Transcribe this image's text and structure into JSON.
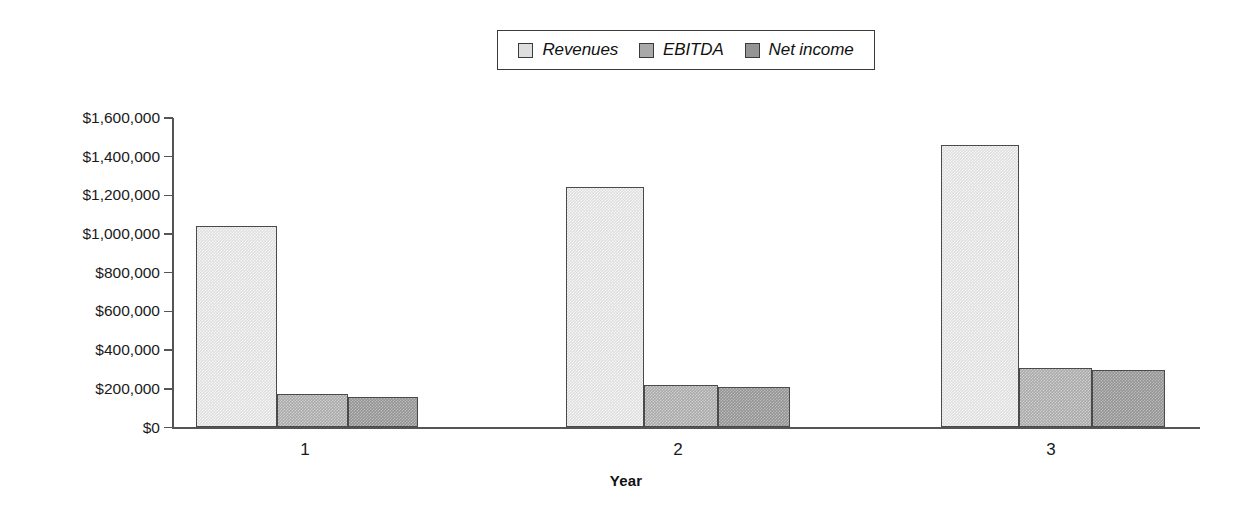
{
  "chart_data": {
    "type": "bar",
    "title": "",
    "subtitle": "",
    "xlabel": "Year",
    "ylabel": "",
    "categories": [
      "1",
      "2",
      "3"
    ],
    "series": [
      {
        "name": "Revenues",
        "color": "#dedede",
        "values": [
          1040000,
          1245000,
          1460000
        ]
      },
      {
        "name": "EBITDA",
        "color": "#a9a9a9",
        "values": [
          175000,
          220000,
          310000
        ]
      },
      {
        "name": "Net income",
        "color": "#949494",
        "values": [
          160000,
          208000,
          298000
        ]
      }
    ],
    "ylim": [
      0,
      1600000
    ],
    "ytick_values": [
      0,
      200000,
      400000,
      600000,
      800000,
      1000000,
      1200000,
      1400000,
      1600000
    ],
    "ytick_labels": [
      "$0",
      "$200,000",
      "$400,000",
      "$600,000",
      "$800,000",
      "$1,000,000",
      "$1,200,000",
      "$1,400,000",
      "$1,600,000"
    ],
    "grid": false,
    "legend_position": "top-center",
    "annotations": []
  },
  "legend": {
    "entries": [
      {
        "label": "Revenues"
      },
      {
        "label": "EBITDA"
      },
      {
        "label": "Net income"
      }
    ]
  },
  "axes": {
    "x_title": "Year",
    "x_categories": [
      "1",
      "2",
      "3"
    ],
    "y_labels": [
      "$1,600,000",
      "$1,400,000",
      "$1,200,000",
      "$1,000,000",
      "$800,000",
      "$600,000",
      "$400,000",
      "$200,000",
      "$0"
    ]
  }
}
